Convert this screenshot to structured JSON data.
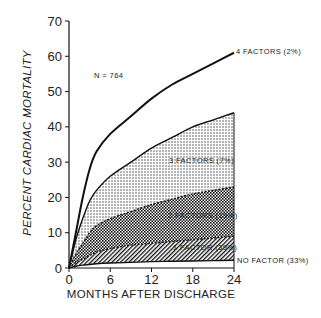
{
  "chart_data": {
    "type": "area",
    "title": "",
    "annotation": "N = 764",
    "xlabel": "MONTHS AFTER DISCHARGE",
    "ylabel": "PERCENT CARDIAC MORTALITY",
    "xlim": [
      0,
      24
    ],
    "ylim": [
      0,
      70
    ],
    "x_ticks": [
      0,
      6,
      12,
      18,
      24
    ],
    "y_ticks": [
      0,
      10,
      20,
      30,
      40,
      50,
      60,
      70
    ],
    "grid": false,
    "legend_position": "direct labels at right end of curves",
    "x": [
      0,
      1,
      2,
      3,
      4,
      6,
      9,
      12,
      15,
      18,
      21,
      24
    ],
    "series": [
      {
        "name": "4 FACTORS (2%)",
        "label": "4 FACTORS (2%)",
        "values": [
          0,
          10,
          20,
          28,
          33,
          38,
          43,
          48,
          52,
          55,
          58,
          61
        ]
      },
      {
        "name": "3 FACTORS (7%)",
        "label": "3 FACTORS (7%)",
        "values": [
          0,
          8,
          14,
          19,
          22,
          26,
          30,
          34,
          37,
          40,
          42,
          44
        ]
      },
      {
        "name": "2 FACTORS (19%)",
        "label": "2 FACTORS (19%)",
        "values": [
          0,
          4,
          7,
          10,
          12,
          14,
          16,
          18,
          19.5,
          21,
          22,
          23
        ]
      },
      {
        "name": "1 FACTOR (39%)",
        "label": "1 FACTOR (39%)",
        "values": [
          0,
          1.5,
          2.5,
          3.5,
          4.5,
          5.5,
          6.5,
          7,
          7.5,
          8,
          8.5,
          9
        ]
      },
      {
        "name": "NO FACTOR (33%)",
        "label": "NO FACTOR (33%)",
        "values": [
          0,
          0.5,
          0.8,
          1,
          1.2,
          1.4,
          1.6,
          1.8,
          1.9,
          2,
          2.1,
          2.2
        ]
      }
    ]
  },
  "labels": {
    "n": "N = 764",
    "four": "4 FACTORS (2%)",
    "three": "3 FACTORS (7%)",
    "two": "2 FACTORS (19%)",
    "one": "1 FACTOR (39%)",
    "none": "NO FACTOR (33%)",
    "xlabel": "MONTHS AFTER DISCHARGE",
    "ylabel": "PERCENT CARDIAC MORTALITY",
    "xticks": [
      "0",
      "6",
      "12",
      "18",
      "24"
    ],
    "yticks": [
      "0",
      "10",
      "20",
      "30",
      "40",
      "50",
      "60",
      "70"
    ]
  }
}
